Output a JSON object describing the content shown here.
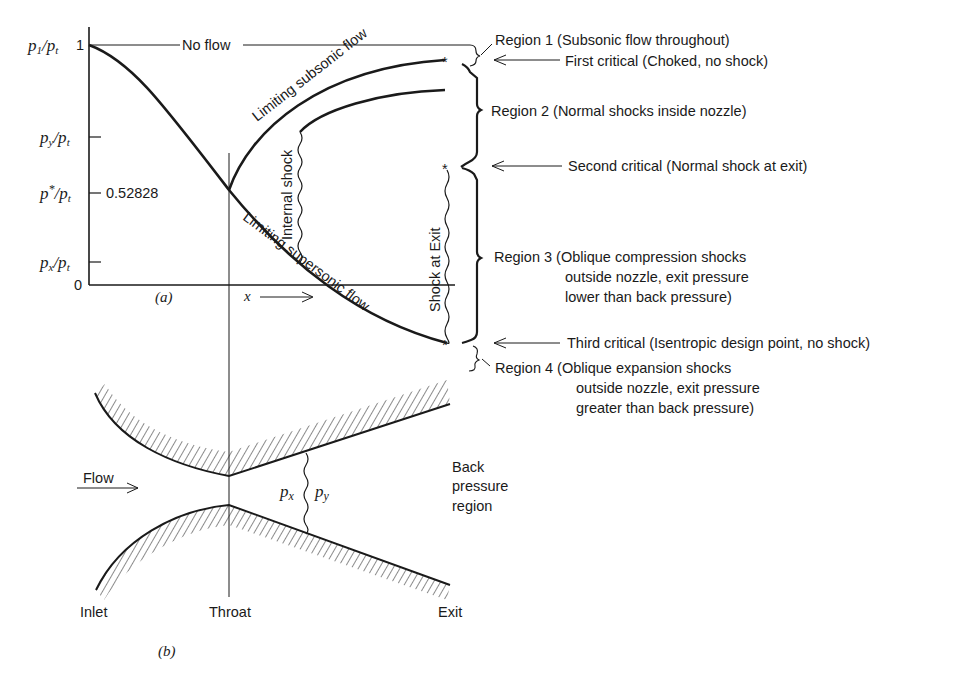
{
  "figure": {
    "panel_a_label": "(a)",
    "panel_b_label": "(b)"
  },
  "axis": {
    "y_ticks": [
      {
        "name": "p1-pt",
        "label_main": "p",
        "label_sub": "1",
        "label_rest": "/p",
        "label_sub2": "t",
        "value_text": "1"
      },
      {
        "name": "py-pt",
        "label_main": "p",
        "label_sub": "y",
        "label_rest": "/p",
        "label_sub2": "t"
      },
      {
        "name": "pstar-pt",
        "label_main": "p",
        "label_sup": "*",
        "label_rest": "/p",
        "label_sub2": "t",
        "value_text": "0.52828"
      },
      {
        "name": "px-pt",
        "label_main": "p",
        "label_sub": "x",
        "label_rest": "/p",
        "label_sub2": "t"
      },
      {
        "name": "zero",
        "value_text": "0"
      }
    ],
    "x_label": "x",
    "x_arrow": "⟶"
  },
  "curves": {
    "no_flow": "No flow",
    "limiting_subsonic": "Limiting subsonic flow",
    "limiting_supersonic": "Limiting supersonic flow",
    "internal_shock": "Internal shock",
    "shock_at_exit": "Shock at Exit"
  },
  "annotations": {
    "region1": "Region 1 (Subsonic flow throughout)",
    "first_critical": "First critical (Choked, no shock)",
    "region2": "Region 2 (Normal shocks inside nozzle)",
    "second_critical": "Second critical (Normal shock at exit)",
    "region3_line1": "Region 3 (Oblique compression shocks",
    "region3_line2": "outside nozzle, exit pressure",
    "region3_line3": "lower than back pressure)",
    "third_critical": "Third critical (Isentropic design point, no shock)",
    "region4_line1": "Region 4  (Oblique expansion shocks",
    "region4_line2": "outside nozzle, exit pressure",
    "region4_line3": "greater than back pressure)"
  },
  "nozzle": {
    "flow_label": "Flow",
    "px_label": "p",
    "px_sub": "x",
    "py_label": "p",
    "py_sub": "y",
    "back_line1": "Back",
    "back_line2": "pressure",
    "back_line3": "region",
    "inlet": "Inlet",
    "throat": "Throat",
    "exit": "Exit"
  },
  "colors": {
    "ink": "#1a1a1a",
    "background": "#ffffff"
  }
}
